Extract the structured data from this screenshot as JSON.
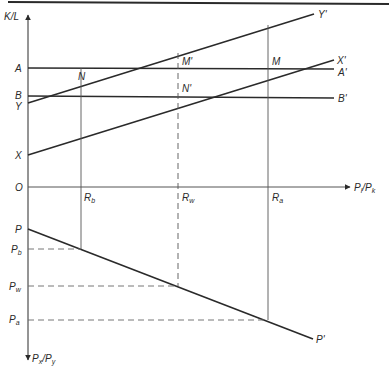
{
  "figure": {
    "colors": {
      "ink": "#2a2a2a",
      "thin": "#555555",
      "dash": "#666666",
      "background": "#ffffff"
    },
    "axes": {
      "vertical_top_label": {
        "base": "K/L",
        "sub": ""
      },
      "vertical_bottom_label": {
        "base": "P",
        "sub": "x",
        "mid": "/P",
        "sub2": "y"
      },
      "horizontal_label": {
        "base": "P",
        "sub": "l",
        "mid": "/P",
        "sub2": "k"
      },
      "origin": "O"
    },
    "left_labels": {
      "A": "A",
      "B": "B",
      "Y": "Y",
      "X": "X",
      "P": "P",
      "Pb": {
        "base": "P",
        "sub": "b"
      },
      "Pw": {
        "base": "P",
        "sub": "w"
      },
      "Pa": {
        "base": "P",
        "sub": "a"
      }
    },
    "right_labels": {
      "Y_prime": "Y'",
      "X_prime": "X'",
      "A_prime": "A'",
      "B_prime": "B'",
      "P_prime": "P'"
    },
    "points": {
      "N": "N",
      "M_prime": "M'",
      "N_prime": "N'",
      "M": "M"
    },
    "x_ticks": {
      "Rb": {
        "base": "R",
        "sub": "b"
      },
      "Rw": {
        "base": "R",
        "sub": "w"
      },
      "Ra": {
        "base": "R",
        "sub": "a"
      }
    },
    "lines": [
      {
        "name": "A-A'",
        "type": "horizontal",
        "from": [
          28,
          68
        ],
        "to": [
          334,
          68
        ]
      },
      {
        "name": "B-B'",
        "type": "horizontal",
        "from": [
          28,
          96
        ],
        "to": [
          334,
          96
        ]
      },
      {
        "name": "Y-Y'",
        "type": "rising",
        "from": [
          28,
          103
        ],
        "to": [
          314,
          14
        ]
      },
      {
        "name": "X-X'",
        "type": "rising",
        "from": [
          28,
          155
        ],
        "to": [
          334,
          60
        ]
      },
      {
        "name": "P-P'",
        "type": "falling",
        "from": [
          28,
          229
        ],
        "to": [
          313,
          339
        ]
      }
    ]
  }
}
